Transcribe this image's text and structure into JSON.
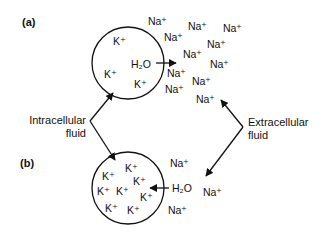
{
  "panels": {
    "a": {
      "label": "(a)"
    },
    "b": {
      "label": "(b)"
    }
  },
  "labels": {
    "intracellular": [
      "Intracellular",
      "fluid"
    ],
    "extracellular": [
      "Extracellular",
      "fluid"
    ]
  },
  "ions": {
    "potassium": "K⁺",
    "sodium": "Na⁺",
    "water": "H₂O"
  },
  "cell_a": {
    "k_count": 3,
    "water_direction": "out",
    "na_outside_count": 12
  },
  "cell_b": {
    "k_count": 8,
    "water_direction": "in",
    "na_outside_count": 3
  },
  "colors": {
    "ink": "#111111",
    "background": "#ffffff"
  }
}
